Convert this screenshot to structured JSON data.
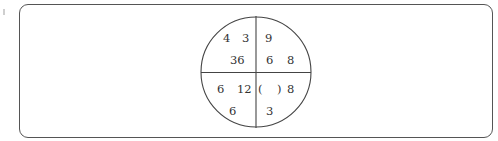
{
  "puzzle": {
    "quadrants": {
      "top_left": {
        "top_a": "4",
        "top_b": "3",
        "bottom": "36"
      },
      "top_right": {
        "top_a": "9",
        "bottom_a": "6",
        "bottom_b": "8"
      },
      "bottom_left": {
        "top_a": "6",
        "top_b": "12",
        "bottom": "6"
      },
      "bottom_right": {
        "blank": "(    )",
        "top_b": "8",
        "bottom": "3"
      }
    },
    "colors": {
      "line": "#444444",
      "text": "#333333"
    }
  }
}
